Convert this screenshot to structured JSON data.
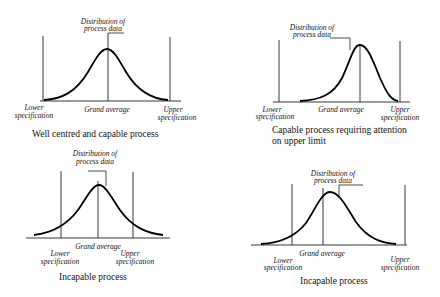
{
  "panels": [
    {
      "id": "well-centred",
      "distribution_label": [
        "Distribution of",
        "process data"
      ],
      "lower_label": [
        "Lower",
        "specification"
      ],
      "upper_label": [
        "Upper",
        "specification"
      ],
      "grand_average_label": "Grand average",
      "caption": [
        "Well centred and capable process"
      ]
    },
    {
      "id": "attention-upper",
      "distribution_label": [
        "Distribution of",
        "process data"
      ],
      "lower_label": [
        "Lower",
        "specification"
      ],
      "upper_label": [
        "Upper",
        "specification"
      ],
      "grand_average_label": "Grand average",
      "caption": [
        "Capable process requiring attention",
        "on upper limit"
      ]
    },
    {
      "id": "incapable-1",
      "distribution_label": [
        "Distribution of",
        "process data"
      ],
      "lower_label": [
        "Lower",
        "specification"
      ],
      "upper_label": [
        "Upper",
        "specification"
      ],
      "grand_average_label": "Grand average",
      "caption": [
        "Incapable process"
      ]
    },
    {
      "id": "incapable-2",
      "distribution_label": [
        "Distribution of",
        "process data"
      ],
      "lower_label": [
        "Lower",
        "specification"
      ],
      "upper_label": [
        "Upper",
        "specification"
      ],
      "grand_average_label": "Grand average",
      "caption": [
        "Incapable process"
      ]
    }
  ]
}
